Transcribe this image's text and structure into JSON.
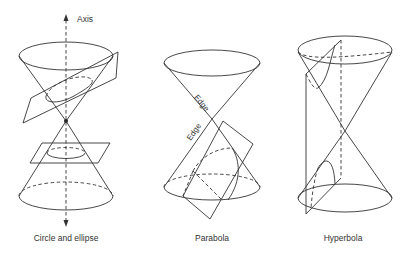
{
  "figure": {
    "panels": [
      {
        "id": "circle-ellipse",
        "caption": "Circle and ellipse",
        "labels": {
          "axis": "Axis"
        }
      },
      {
        "id": "parabola",
        "caption": "Parabola",
        "labels": {
          "edge_upper": "Edge",
          "edge_lower": "Edge"
        }
      },
      {
        "id": "hyperbola",
        "caption": "Hyperbola"
      }
    ],
    "colors": {
      "stroke": "#333333",
      "background": "#ffffff"
    }
  }
}
